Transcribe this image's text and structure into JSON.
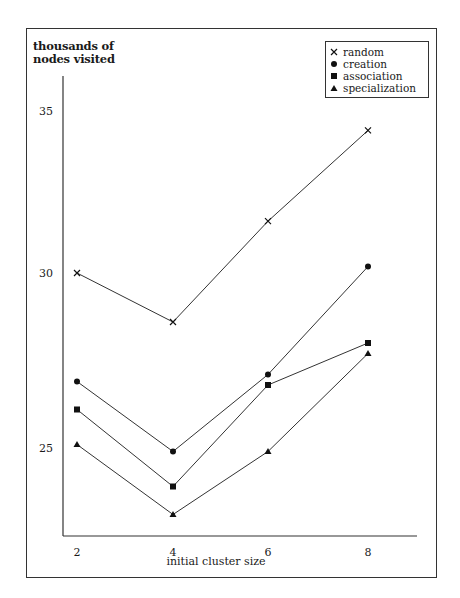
{
  "chart_data": {
    "type": "line",
    "title": "",
    "xlabel": "initial cluster size",
    "ylabel": "thousands of nodes visited",
    "ylabel_lines": [
      "thousands of",
      "nodes visited"
    ],
    "x": [
      2,
      4,
      6,
      8
    ],
    "x_ticks": [
      "2",
      "4",
      "6",
      "8"
    ],
    "y_ticks": [
      "25",
      "30",
      "35"
    ],
    "ylim": [
      22.5,
      36.5
    ],
    "grid": false,
    "legend_position": "top-right",
    "series": [
      {
        "name": "random",
        "marker": "x",
        "values": [
          30.0,
          28.6,
          31.6,
          34.4
        ]
      },
      {
        "name": "creation",
        "marker": "circle",
        "values": [
          26.9,
          24.9,
          27.1,
          30.2
        ]
      },
      {
        "name": "association",
        "marker": "square",
        "values": [
          26.1,
          23.9,
          26.8,
          28.0
        ]
      },
      {
        "name": "specialization",
        "marker": "triangle",
        "values": [
          25.1,
          23.1,
          24.9,
          27.7
        ]
      }
    ]
  },
  "colors": {
    "line": "#333333",
    "marker": "#111111",
    "frame": "#333333"
  }
}
